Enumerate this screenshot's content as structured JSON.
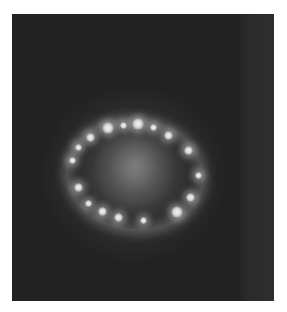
{
  "image": {
    "subject": "ring of bright knots around a diffuse central glow",
    "frame": {
      "x": 12,
      "y": 14,
      "width": 262,
      "height": 287
    },
    "colors": {
      "page_background": "#ffffff",
      "sky_background": "#222222",
      "ring_glow": "#aaaaaa",
      "knot_core": "#f4f4f4"
    },
    "ring_center": {
      "x": 135,
      "y": 172
    },
    "knots": [
      {
        "x": 108,
        "y": 128,
        "size": "big"
      },
      {
        "x": 123,
        "y": 125,
        "size": "small"
      },
      {
        "x": 138,
        "y": 124,
        "size": "big"
      },
      {
        "x": 153,
        "y": 127,
        "size": "small"
      },
      {
        "x": 168,
        "y": 135,
        "size": "normal"
      },
      {
        "x": 188,
        "y": 150,
        "size": "normal"
      },
      {
        "x": 198,
        "y": 175,
        "size": "small"
      },
      {
        "x": 190,
        "y": 197,
        "size": "normal"
      },
      {
        "x": 177,
        "y": 212,
        "size": "big"
      },
      {
        "x": 143,
        "y": 220,
        "size": "small"
      },
      {
        "x": 118,
        "y": 217,
        "size": "normal"
      },
      {
        "x": 102,
        "y": 211,
        "size": "normal"
      },
      {
        "x": 88,
        "y": 203,
        "size": "small"
      },
      {
        "x": 78,
        "y": 187,
        "size": "normal"
      },
      {
        "x": 72,
        "y": 160,
        "size": "small"
      },
      {
        "x": 78,
        "y": 147,
        "size": "small"
      },
      {
        "x": 90,
        "y": 137,
        "size": "normal"
      }
    ]
  }
}
